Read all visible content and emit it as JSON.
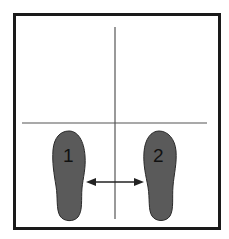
{
  "diagram": {
    "title": "",
    "colors": {
      "frame": "#1a1a1a",
      "guide_lines": "#555555",
      "foot_fill": "#5a5a5a",
      "foot_stroke": "#2a2a2a",
      "arrow": "#222222",
      "background": "#ffffff"
    },
    "frame": {
      "x": 14,
      "y": 14,
      "width": 206,
      "height": 215
    },
    "horizontal_line": {
      "x1": 22,
      "y1": 123,
      "x2": 207,
      "y2": 123
    },
    "vertical_line": {
      "x1": 115,
      "y1": 27,
      "x2": 115,
      "y2": 219
    },
    "feet": [
      {
        "id": "1",
        "label": "1",
        "side": "left"
      },
      {
        "id": "2",
        "label": "2",
        "side": "right"
      }
    ],
    "arrow": {
      "x1": 86,
      "x2": 144,
      "y": 182,
      "direction": "both"
    }
  }
}
